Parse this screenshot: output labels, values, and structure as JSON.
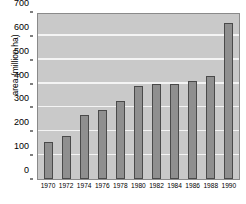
{
  "chart_data": {
    "type": "bar",
    "title": "",
    "xlabel": "",
    "ylabel": "area (million ha)",
    "categories": [
      "1970",
      "1972",
      "1974",
      "1976",
      "1978",
      "1980",
      "1982",
      "1984",
      "1986",
      "1988",
      "1990"
    ],
    "values": [
      155,
      180,
      270,
      288,
      328,
      390,
      398,
      400,
      412,
      432,
      655
    ],
    "ylim": [
      0,
      700
    ],
    "ytick_values": [
      0,
      100,
      200,
      300,
      400,
      500,
      600,
      700
    ],
    "ytick_labels": [
      "0",
      "100",
      "200",
      "300",
      "400",
      "500",
      "600",
      "700"
    ],
    "grid": true,
    "legend": "none",
    "colors": {
      "plot_background": "#c9c9c9",
      "gridline": "#f4f4f4",
      "bar_fill": "#8f8f8f",
      "bar_edge": "#4a4a4a",
      "text": "#000000",
      "page_background": "#ffffff"
    }
  }
}
